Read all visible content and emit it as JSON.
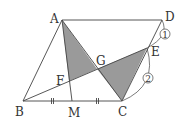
{
  "diagram": {
    "points": {
      "A": {
        "label": "A",
        "x": 62,
        "y": 20
      },
      "D": {
        "label": "D",
        "x": 162,
        "y": 20
      },
      "B": {
        "label": "B",
        "x": 23,
        "y": 101
      },
      "C": {
        "label": "C",
        "x": 122,
        "y": 101
      },
      "M": {
        "label": "M",
        "x": 72,
        "y": 101
      },
      "E": {
        "label": "E",
        "x": 147,
        "y": 48
      },
      "G": {
        "label": "G",
        "x": 97,
        "y": 69
      },
      "F": {
        "label": "F",
        "x": 69,
        "y": 81
      }
    },
    "ratio_marks": {
      "DE": "①",
      "EC": "②"
    },
    "shaded_color": "#9a9a9a",
    "line_color": "#444444"
  }
}
